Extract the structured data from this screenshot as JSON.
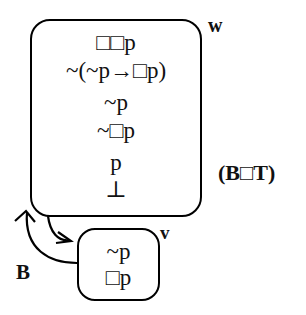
{
  "diagram": {
    "system_label": "(B□T)",
    "worlds": [
      {
        "id": "w",
        "label": "w",
        "formulas": [
          "□□p",
          "~(~p→□p)",
          "~p",
          "~□p",
          "p",
          "⊥"
        ]
      },
      {
        "id": "v",
        "label": "v",
        "formulas": [
          "~p",
          "□p"
        ]
      }
    ],
    "relations": [
      {
        "from": "w",
        "to": "v",
        "type": "accessibility-arrow"
      },
      {
        "from": "v",
        "to": "w",
        "type": "accessibility-arrow",
        "label": "B"
      }
    ],
    "relation_label": "B",
    "colors": {
      "line": "#000000",
      "text": "#111111",
      "background": "#ffffff"
    }
  }
}
